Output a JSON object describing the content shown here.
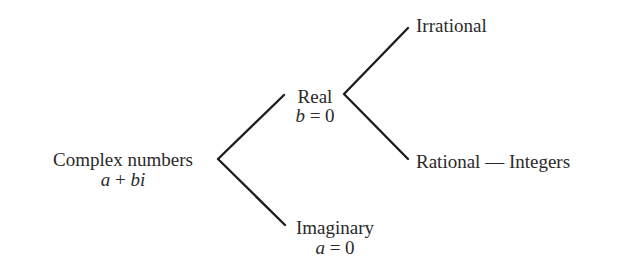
{
  "diagram": {
    "type": "tree",
    "nodes": {
      "complex": {
        "label": "Complex numbers",
        "formula": {
          "a": "a",
          "op": " + ",
          "b": "bi"
        }
      },
      "real": {
        "label": "Real",
        "formula": {
          "var": "b",
          "op": " = ",
          "val": "0"
        }
      },
      "imaginary": {
        "label": "Imaginary",
        "formula": {
          "var": "a",
          "op": " = ",
          "val": "0"
        }
      },
      "irrational": {
        "label": "Irrational"
      },
      "rational": {
        "label": "Rational — Integers"
      }
    },
    "edges": [
      [
        "complex",
        "real"
      ],
      [
        "complex",
        "imaginary"
      ],
      [
        "real",
        "irrational"
      ],
      [
        "real",
        "rational"
      ]
    ],
    "colors": {
      "line": "#1e1e1e",
      "text": "#2a2a2a",
      "background": "#ffffff"
    }
  }
}
